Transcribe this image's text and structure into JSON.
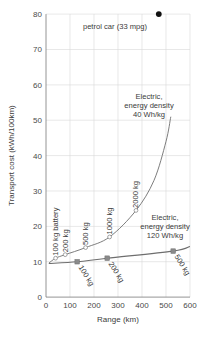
{
  "chart_data": {
    "type": "line",
    "title": "",
    "xlabel": "Range (km)",
    "ylabel": "Transport cost (kWh/100km)",
    "xlim": [
      0,
      600
    ],
    "ylim": [
      0,
      80
    ],
    "xticks": [
      "0",
      "100",
      "200",
      "300",
      "400",
      "500",
      "600"
    ],
    "yticks": [
      "0",
      "10",
      "20",
      "30",
      "40",
      "50",
      "60",
      "70",
      "80"
    ],
    "grid": true,
    "legend": "none",
    "series": [
      {
        "name": "Electric, energy density 40 Wh/kg",
        "marker": "open-circle",
        "point_labels": [
          "100 kg battery",
          "200 kg",
          "500 kg",
          "1000 kg",
          "2000 kg"
        ],
        "x": [
          40,
          80,
          165,
          265,
          375
        ],
        "y": [
          11.0,
          12.0,
          14.0,
          17.0,
          24.5
        ],
        "curve_x": [
          12,
          40,
          80,
          165,
          265,
          375,
          450,
          500,
          520
        ],
        "curve_y": [
          9.6,
          11.0,
          12.0,
          14.0,
          17.0,
          24.5,
          33.0,
          44.0,
          51.0
        ]
      },
      {
        "name": "Electric, energy density 120 Wh/kg",
        "marker": "filled-square",
        "point_labels": [
          "100 kg",
          "200 kg",
          "500 kg"
        ],
        "x": [
          130,
          255,
          530
        ],
        "y": [
          10.0,
          11.0,
          13.0
        ],
        "curve_x": [
          12,
          130,
          255,
          530,
          600
        ],
        "curve_y": [
          9.5,
          10.0,
          11.0,
          13.0,
          14.3
        ]
      },
      {
        "name": "petrol car (33 mpg)",
        "marker": "filled-circle",
        "x": [
          470
        ],
        "y": [
          80.0
        ]
      }
    ],
    "annotations": [
      {
        "text_line1": "petrol car (33 mpg)",
        "x": 320,
        "y": 76
      },
      {
        "text_line1": "Electric,",
        "text_line2": "energy density",
        "text_line3": "40 Wh/kg",
        "x": 340,
        "y": 57
      },
      {
        "text_line1": "Electric,",
        "text_line2": "energy density",
        "text_line3": "120 Wh/kg",
        "x": 440,
        "y": 21
      }
    ],
    "colors": {
      "line": "#6e6e6e",
      "marker_fill": "#8a8a8a",
      "petrol_dot": "#111111",
      "grid": "#d8d8d8",
      "axis": "#7a7a7a",
      "text": "#3b3b3b"
    }
  },
  "axes": {
    "y_title": "Transport cost (kWh/100km)",
    "x_title": "Range (km)",
    "y_tick_0": "0",
    "y_tick_10": "10",
    "y_tick_20": "20",
    "y_tick_30": "30",
    "y_tick_40": "40",
    "y_tick_50": "50",
    "y_tick_60": "60",
    "y_tick_70": "70",
    "y_tick_80": "80",
    "x_tick_0": "0",
    "x_tick_100": "100",
    "x_tick_200": "200",
    "x_tick_300": "300",
    "x_tick_400": "400",
    "x_tick_500": "500",
    "x_tick_600": "600"
  },
  "annotations": {
    "petrol": "petrol car (33 mpg)",
    "e40_l1": "Electric,",
    "e40_l2": "energy density",
    "e40_l3": "40 Wh/kg",
    "e120_l1": "Electric,",
    "e120_l2": "energy density",
    "e120_l3": "120 Wh/kg"
  },
  "curve_labels": {
    "a_100": "100 kg battery",
    "a_200": "200 kg",
    "a_500": "500 kg",
    "a_1000": "1000 kg",
    "a_2000": "2000 kg",
    "b_100": "100 kg",
    "b_200": "200 kg",
    "b_500": "500 kg"
  }
}
